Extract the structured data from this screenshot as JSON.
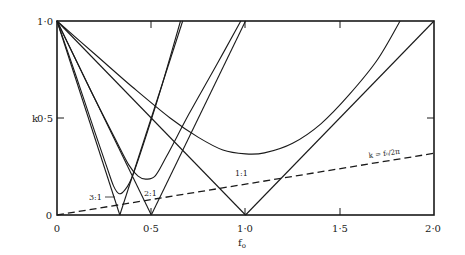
{
  "chart_data": {
    "type": "line",
    "title": "",
    "xlabel": "f₀",
    "ylabel": "k",
    "xlim": [
      0,
      2.0
    ],
    "ylim": [
      0,
      1.0
    ],
    "grid": false,
    "x_ticks": [
      {
        "value": 0,
        "label": "0"
      },
      {
        "value": 0.5,
        "label": "0·5"
      },
      {
        "value": 1.0,
        "label": "1·0"
      },
      {
        "value": 1.5,
        "label": "1·5"
      },
      {
        "value": 2.0,
        "label": "2·0"
      }
    ],
    "y_ticks": [
      {
        "value": 0,
        "label": "0"
      },
      {
        "value": 0.5,
        "label": "0·5"
      },
      {
        "value": 1.0,
        "label": "1·0"
      }
    ],
    "series": [
      {
        "name": "3:1 boundary (left)",
        "style": "solid",
        "points": [
          [
            0,
            1.0
          ],
          [
            0.333,
            0.0
          ]
        ]
      },
      {
        "name": "3:1 boundary (right)",
        "style": "solid",
        "points": [
          [
            0.333,
            0.0
          ],
          [
            0.667,
            1.0
          ]
        ]
      },
      {
        "name": "2:1 boundary (left)",
        "style": "solid",
        "points": [
          [
            0,
            1.0
          ],
          [
            0.5,
            0.0
          ]
        ]
      },
      {
        "name": "2:1 boundary (right)",
        "style": "solid",
        "points": [
          [
            0.5,
            0.0
          ],
          [
            1.0,
            1.0
          ]
        ]
      },
      {
        "name": "1:1 boundary (left)",
        "style": "solid",
        "points": [
          [
            0,
            1.0
          ],
          [
            1.0,
            0.0
          ]
        ]
      },
      {
        "name": "1:1 boundary (right)",
        "style": "solid",
        "points": [
          [
            1.0,
            0.0
          ],
          [
            2.0,
            1.0
          ]
        ]
      },
      {
        "name": "3:1 curve",
        "style": "solid",
        "points": [
          [
            0,
            1.0
          ],
          [
            0.1,
            0.72
          ],
          [
            0.2,
            0.43
          ],
          [
            0.26,
            0.26
          ],
          [
            0.3,
            0.15
          ],
          [
            0.33,
            0.11
          ],
          [
            0.36,
            0.13
          ],
          [
            0.4,
            0.2
          ],
          [
            0.48,
            0.43
          ],
          [
            0.56,
            0.68
          ],
          [
            0.655,
            1.0
          ]
        ]
      },
      {
        "name": "2:1 curve",
        "style": "solid",
        "points": [
          [
            0,
            1.0
          ],
          [
            0.1,
            0.8
          ],
          [
            0.2,
            0.6
          ],
          [
            0.3,
            0.41
          ],
          [
            0.38,
            0.26
          ],
          [
            0.43,
            0.2
          ],
          [
            0.47,
            0.185
          ],
          [
            0.52,
            0.2
          ],
          [
            0.58,
            0.3
          ],
          [
            0.7,
            0.52
          ],
          [
            0.85,
            0.78
          ],
          [
            0.975,
            1.0
          ]
        ]
      },
      {
        "name": "1:1 curve",
        "style": "solid",
        "points": [
          [
            0,
            1.0
          ],
          [
            0.2,
            0.83
          ],
          [
            0.4,
            0.66
          ],
          [
            0.6,
            0.5
          ],
          [
            0.75,
            0.4
          ],
          [
            0.88,
            0.335
          ],
          [
            1.0,
            0.315
          ],
          [
            1.1,
            0.32
          ],
          [
            1.25,
            0.37
          ],
          [
            1.4,
            0.47
          ],
          [
            1.55,
            0.62
          ],
          [
            1.7,
            0.8
          ],
          [
            1.82,
            1.0
          ]
        ]
      },
      {
        "name": "k = f₀/2π",
        "style": "dashed",
        "points": [
          [
            0,
            0.0
          ],
          [
            2.0,
            0.318
          ]
        ]
      }
    ],
    "annotations": [
      {
        "text": "3:1",
        "x": 0.17,
        "y": 0.1,
        "arrow_to": [
          0.3,
          0.1
        ]
      },
      {
        "text": "2:1",
        "x": 0.47,
        "y": 0.12
      },
      {
        "text": "1:1",
        "x": 1.0,
        "y": 0.22
      },
      {
        "text": "k = f₀/2π",
        "x": 1.54,
        "y": 0.3
      }
    ]
  },
  "labels": {
    "ylabel": "k",
    "xlabel": "f",
    "xlabel_sub": "o",
    "ytick_1": "1·0",
    "ytick_05": "0·5",
    "ytick_0": "0",
    "xtick_0": "0",
    "xtick_05": "0·5",
    "xtick_10": "1·0",
    "xtick_15": "1·5",
    "xtick_20": "2·0",
    "ann_31": "3:1",
    "ann_21": "2:1",
    "ann_11": "1:1",
    "ann_eq": "k = f₀/2π"
  }
}
